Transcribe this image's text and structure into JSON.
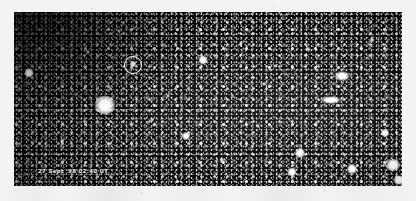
{
  "photo": {
    "kind": "astronomical-star-field-photograph",
    "timestamp_caption": "27 Sept '98 02:40 UT",
    "frame": {
      "x": 14,
      "y": 12,
      "width": 388,
      "height": 174
    },
    "background_color": "#060606",
    "page_color": "#f4f3f1",
    "annotation_color": "#ffffff"
  },
  "annotation": {
    "type": "circle",
    "label": "target-object-circle",
    "center_x": 133,
    "center_y": 65,
    "radius": 9
  },
  "stars": [
    {
      "x": 29,
      "y": 73,
      "size": 9,
      "w": 9,
      "h": 9,
      "class": "star",
      "name": "bright-star-left"
    },
    {
      "x": 105,
      "y": 105,
      "size": 21,
      "w": 21,
      "h": 19,
      "class": "star",
      "name": "bright-star-brightest"
    },
    {
      "x": 133,
      "y": 64,
      "size": 6,
      "w": 6,
      "h": 7,
      "class": "star",
      "name": "circled-target-object"
    },
    {
      "x": 203,
      "y": 60,
      "size": 9,
      "w": 9,
      "h": 9,
      "class": "star",
      "name": "bright-star-upper-mid"
    },
    {
      "x": 186,
      "y": 136,
      "size": 8,
      "w": 8,
      "h": 8,
      "class": "star",
      "name": "bright-star-lower-mid"
    },
    {
      "x": 342,
      "y": 76,
      "size": 14,
      "w": 18,
      "h": 12,
      "class": "star elong",
      "name": "bright-star-upper-right"
    },
    {
      "x": 331,
      "y": 100,
      "size": 14,
      "w": 24,
      "h": 9,
      "class": "star elong",
      "name": "elongated-object-right"
    },
    {
      "x": 300,
      "y": 153,
      "size": 10,
      "w": 10,
      "h": 10,
      "class": "star",
      "name": "bright-star-bottom-left-of-right"
    },
    {
      "x": 292,
      "y": 172,
      "size": 9,
      "w": 9,
      "h": 9,
      "class": "star",
      "name": "bright-star-bottom-edge"
    },
    {
      "x": 352,
      "y": 169,
      "size": 10,
      "w": 10,
      "h": 10,
      "class": "star",
      "name": "bright-star-bottom-mid-right"
    },
    {
      "x": 385,
      "y": 133,
      "size": 8,
      "w": 8,
      "h": 8,
      "class": "star",
      "name": "bright-star-far-right"
    },
    {
      "x": 393,
      "y": 165,
      "size": 13,
      "w": 15,
      "h": 12,
      "class": "star",
      "name": "bright-star-bottom-right-corner"
    },
    {
      "x": 399,
      "y": 180,
      "size": 10,
      "w": 12,
      "h": 9,
      "class": "star",
      "name": "bright-star-corner-edge"
    },
    {
      "x": 308,
      "y": 49,
      "size": 5,
      "w": 5,
      "h": 5,
      "class": "star soft",
      "name": "faint-star-a"
    },
    {
      "x": 264,
      "y": 84,
      "size": 4,
      "w": 4,
      "h": 4,
      "class": "star soft",
      "name": "faint-star-b"
    },
    {
      "x": 241,
      "y": 43,
      "size": 4,
      "w": 4,
      "h": 4,
      "class": "star soft",
      "name": "faint-star-c"
    },
    {
      "x": 168,
      "y": 96,
      "size": 4,
      "w": 4,
      "h": 4,
      "class": "star soft",
      "name": "faint-star-d"
    },
    {
      "x": 119,
      "y": 31,
      "size": 4,
      "w": 4,
      "h": 4,
      "class": "star soft",
      "name": "faint-star-e"
    },
    {
      "x": 62,
      "y": 141,
      "size": 4,
      "w": 4,
      "h": 4,
      "class": "star soft",
      "name": "faint-star-f"
    },
    {
      "x": 222,
      "y": 160,
      "size": 5,
      "w": 5,
      "h": 5,
      "class": "star soft",
      "name": "faint-star-g"
    },
    {
      "x": 372,
      "y": 40,
      "size": 5,
      "w": 5,
      "h": 5,
      "class": "star soft",
      "name": "faint-star-h"
    },
    {
      "x": 152,
      "y": 120,
      "size": 4,
      "w": 4,
      "h": 4,
      "class": "star soft",
      "name": "faint-star-i"
    },
    {
      "x": 258,
      "y": 126,
      "size": 4,
      "w": 4,
      "h": 4,
      "class": "star soft",
      "name": "faint-star-j"
    },
    {
      "x": 88,
      "y": 52,
      "size": 4,
      "w": 4,
      "h": 4,
      "class": "star soft",
      "name": "faint-star-k"
    },
    {
      "x": 275,
      "y": 66,
      "size": 4,
      "w": 4,
      "h": 4,
      "class": "star soft",
      "name": "faint-star-l"
    }
  ]
}
